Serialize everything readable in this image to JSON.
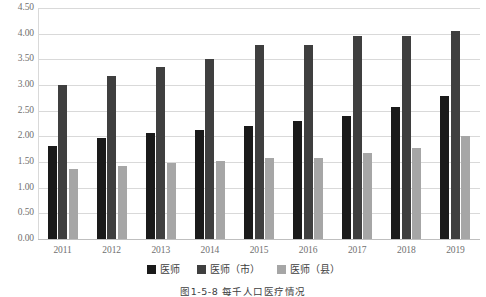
{
  "chart_data": {
    "type": "bar",
    "title": "",
    "caption": "图1-5-8  每千人口医疗情况",
    "xlabel": "",
    "ylabel": "",
    "categories": [
      "2011",
      "2012",
      "2013",
      "2014",
      "2015",
      "2016",
      "2017",
      "2018",
      "2019"
    ],
    "series": [
      {
        "name": "医师",
        "color": "#1a1a1a",
        "values": [
          1.82,
          1.96,
          2.06,
          2.12,
          2.21,
          2.3,
          2.4,
          2.57,
          2.79
        ]
      },
      {
        "name": "医师（市）",
        "color": "#3f3f3f",
        "values": [
          3.0,
          3.17,
          3.35,
          3.5,
          3.78,
          3.78,
          3.95,
          3.95,
          4.05
        ]
      },
      {
        "name": "医师（县）",
        "color": "#a6a6a6",
        "values": [
          1.37,
          1.42,
          1.48,
          1.52,
          1.58,
          1.58,
          1.67,
          1.78,
          2.0
        ]
      }
    ],
    "ylim": [
      0,
      4.5
    ],
    "ytick_step": 0.5,
    "ytick_labels": [
      "0.00",
      "0.50",
      "1.00",
      "1.50",
      "2.00",
      "2.50",
      "3.00",
      "3.50",
      "4.00",
      "4.50"
    ],
    "grid": true,
    "legend_position": "bottom"
  }
}
